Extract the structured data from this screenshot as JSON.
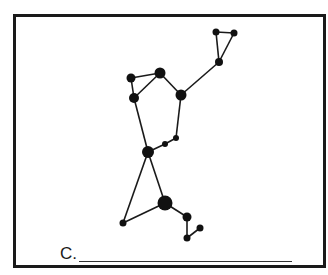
{
  "figure": {
    "type": "constellation-diagram",
    "label": "C.",
    "answer_blank": "",
    "colors": {
      "stroke": "#1a1a1a",
      "star": "#111111",
      "border": "#1a1a1a",
      "background": "#ffffff"
    }
  },
  "stars": [
    {
      "id": "s1",
      "x": 216,
      "y": 32,
      "r": 3.5
    },
    {
      "id": "s2",
      "x": 234,
      "y": 33,
      "r": 3.5
    },
    {
      "id": "s3",
      "x": 219,
      "y": 62,
      "r": 4
    },
    {
      "id": "s4",
      "x": 181,
      "y": 95,
      "r": 5.5
    },
    {
      "id": "s5",
      "x": 160,
      "y": 73,
      "r": 5.5
    },
    {
      "id": "s6",
      "x": 131,
      "y": 78,
      "r": 4.5
    },
    {
      "id": "s7",
      "x": 134,
      "y": 98,
      "r": 5
    },
    {
      "id": "s8",
      "x": 176,
      "y": 138,
      "r": 3
    },
    {
      "id": "s9",
      "x": 165,
      "y": 144,
      "r": 3
    },
    {
      "id": "s10",
      "x": 148,
      "y": 152,
      "r": 6
    },
    {
      "id": "s11",
      "x": 165,
      "y": 203,
      "r": 7.5
    },
    {
      "id": "s12",
      "x": 123,
      "y": 223,
      "r": 3.5
    },
    {
      "id": "s13",
      "x": 187,
      "y": 217,
      "r": 4.5
    },
    {
      "id": "s14",
      "x": 187,
      "y": 238,
      "r": 3.5
    },
    {
      "id": "s15",
      "x": 200,
      "y": 228,
      "r": 3.5
    }
  ],
  "lines": [
    [
      "s1",
      "s2"
    ],
    [
      "s1",
      "s3"
    ],
    [
      "s2",
      "s3"
    ],
    [
      "s3",
      "s4"
    ],
    [
      "s4",
      "s5"
    ],
    [
      "s5",
      "s6"
    ],
    [
      "s5",
      "s7"
    ],
    [
      "s6",
      "s7"
    ],
    [
      "s4",
      "s8"
    ],
    [
      "s8",
      "s9"
    ],
    [
      "s9",
      "s10"
    ],
    [
      "s7",
      "s10"
    ],
    [
      "s10",
      "s11"
    ],
    [
      "s10",
      "s12"
    ],
    [
      "s12",
      "s11"
    ],
    [
      "s11",
      "s13"
    ],
    [
      "s13",
      "s14"
    ],
    [
      "s14",
      "s15"
    ]
  ]
}
